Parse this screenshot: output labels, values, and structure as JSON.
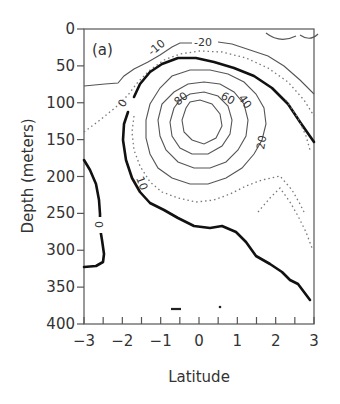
{
  "chart_data": {
    "type": "contour",
    "panel_label": "(a)",
    "xlabel": "Latitude",
    "ylabel": "Depth (meters)",
    "xlim": [
      -3,
      3
    ],
    "ylim": [
      400,
      0
    ],
    "x_ticks": [
      "-3",
      "-2",
      "-1",
      "0",
      "1",
      "2",
      "3"
    ],
    "y_ticks": [
      "0",
      "50",
      "100",
      "150",
      "200",
      "250",
      "300",
      "350",
      "400"
    ],
    "grid": false,
    "contour_levels": [
      -20,
      -10,
      0,
      10,
      20,
      40,
      60,
      80
    ],
    "contour_labels": [
      {
        "text": "-20",
        "lat": 0.2,
        "depth": 20
      },
      {
        "text": "-10",
        "lat": -1.0,
        "depth": 45
      },
      {
        "text": "0",
        "lat": -1.95,
        "depth": 118
      },
      {
        "text": "10",
        "lat": -1.6,
        "depth": 205
      },
      {
        "text": "80",
        "lat": -0.75,
        "depth": 110
      },
      {
        "text": "60",
        "lat": 0.55,
        "depth": 95
      },
      {
        "text": "40",
        "lat": 1.05,
        "depth": 100
      },
      {
        "text": "20",
        "lat": 1.75,
        "depth": 138
      },
      {
        "text": "0",
        "lat": -2.55,
        "depth": 255
      }
    ],
    "annotations": [
      "Core maximum > 80 near 0 latitude, ~120 m depth",
      "Zero contour drawn bold",
      "Dotted contours at intermediate levels"
    ]
  },
  "figure": {
    "panel_label": "(a)",
    "xlabel": "Latitude",
    "ylabel": "Depth (meters)"
  }
}
